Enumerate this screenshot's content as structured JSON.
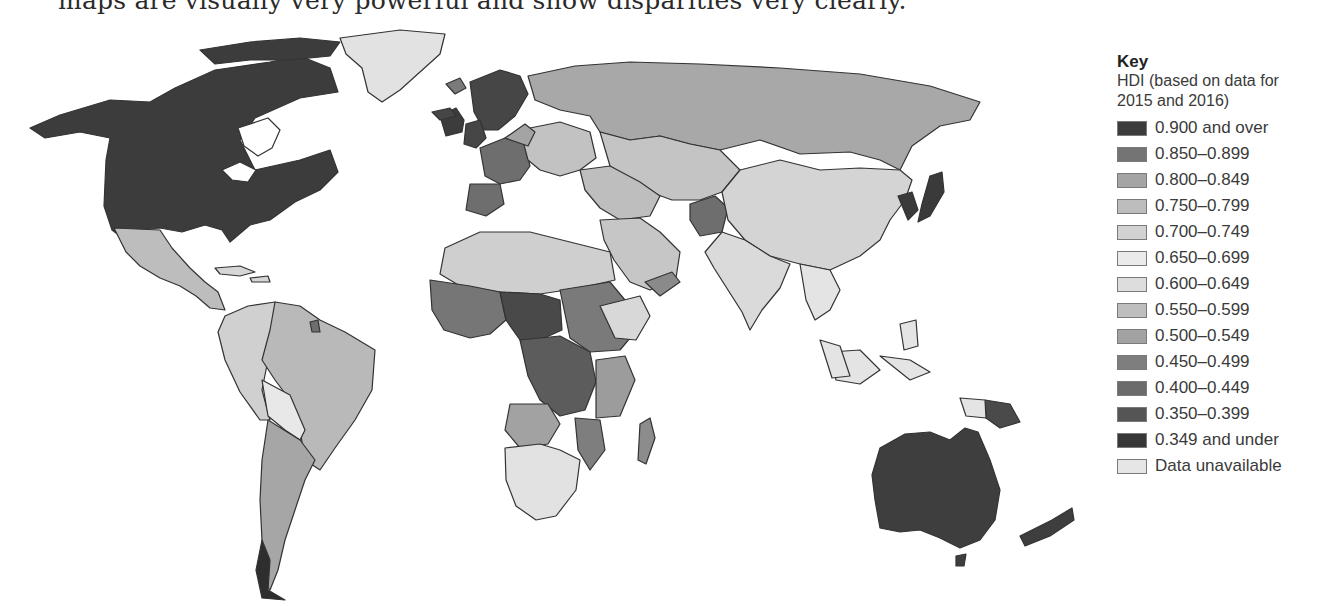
{
  "caption": "maps are visually very powerful and show disparities very clearly.",
  "legend": {
    "title": "Key",
    "subtitle_line1": "HDI (based on data for",
    "subtitle_line2": "2015 and 2016)",
    "items": [
      {
        "label": "0.900 and over",
        "color": "#3c3c3c"
      },
      {
        "label": "0.850–0.899",
        "color": "#747474"
      },
      {
        "label": "0.800–0.849",
        "color": "#a4a4a4"
      },
      {
        "label": "0.750–0.799",
        "color": "#bdbdbd"
      },
      {
        "label": "0.700–0.749",
        "color": "#d2d2d2"
      },
      {
        "label": "0.650–0.699",
        "color": "#ebebeb"
      },
      {
        "label": "0.600–0.649",
        "color": "#dddddd"
      },
      {
        "label": "0.550–0.599",
        "color": "#bebebe"
      },
      {
        "label": "0.500–0.549",
        "color": "#a2a2a2"
      },
      {
        "label": "0.450–0.499",
        "color": "#7e7e7e"
      },
      {
        "label": "0.400–0.449",
        "color": "#6b6b6b"
      },
      {
        "label": "0.350–0.399",
        "color": "#555555"
      },
      {
        "label": "0.349 and under",
        "color": "#373737"
      },
      {
        "label": "Data unavailable",
        "color": "#e6e6e6"
      }
    ]
  },
  "map": {
    "title": "World map of Human Development Index (HDI)",
    "regions": [
      {
        "name": "North America (USA, Canada)",
        "band": "0.900 and over",
        "color": "#3c3c3c"
      },
      {
        "name": "Greenland",
        "band": "Data unavailable",
        "color": "#e2e2e2"
      },
      {
        "name": "Mexico & Central America",
        "band": "0.750–0.799",
        "color": "#bdbdbd"
      },
      {
        "name": "Brazil",
        "band": "0.750–0.799",
        "color": "#b9b9b9"
      },
      {
        "name": "Andean countries",
        "band": "0.700–0.749",
        "color": "#d0d0d0"
      },
      {
        "name": "Bolivia / Paraguay",
        "band": "0.650–0.699",
        "color": "#e8e8e8"
      },
      {
        "name": "Argentina / Chile",
        "band": "0.800–0.849",
        "color": "#a6a6a6"
      },
      {
        "name": "Western Europe",
        "band": "0.900 and over",
        "color": "#464646"
      },
      {
        "name": "Southern Europe",
        "band": "0.850–0.899",
        "color": "#6e6e6e"
      },
      {
        "name": "Eastern Europe",
        "band": "0.750–0.799",
        "color": "#c2c2c2"
      },
      {
        "name": "Russia",
        "band": "0.800–0.849",
        "color": "#a8a8a8"
      },
      {
        "name": "Central Asia",
        "band": "0.750–0.799",
        "color": "#c4c4c4"
      },
      {
        "name": "China",
        "band": "0.700–0.749",
        "color": "#d4d4d4"
      },
      {
        "name": "Afghanistan",
        "band": "0.450–0.499",
        "color": "#6e6e6e"
      },
      {
        "name": "India",
        "band": "0.600–0.649",
        "color": "#dadada"
      },
      {
        "name": "North Africa",
        "band": "0.700–0.749",
        "color": "#cfcfcf"
      },
      {
        "name": "Sahel",
        "band": "0.349 and under",
        "color": "#494949"
      },
      {
        "name": "West Africa",
        "band": "0.450–0.499",
        "color": "#767676"
      },
      {
        "name": "Central Africa",
        "band": "0.400–0.449",
        "color": "#5c5c5c"
      },
      {
        "name": "East Africa",
        "band": "0.450–0.499",
        "color": "#7a7a7a"
      },
      {
        "name": "Southern Africa",
        "band": "0.650–0.699",
        "color": "#e2e2e2"
      },
      {
        "name": "Madagascar",
        "band": "0.500–0.549",
        "color": "#8c8c8c"
      },
      {
        "name": "Japan / Korea",
        "band": "0.900 and over",
        "color": "#3a3a3a"
      },
      {
        "name": "Southeast Asia",
        "band": "0.650–0.699",
        "color": "#e4e4e4"
      },
      {
        "name": "Australia / New Zealand",
        "band": "0.900 and over",
        "color": "#3e3e3e"
      },
      {
        "name": "Papua New Guinea",
        "band": "0.500–0.549",
        "color": "#4a4a4a"
      }
    ]
  }
}
